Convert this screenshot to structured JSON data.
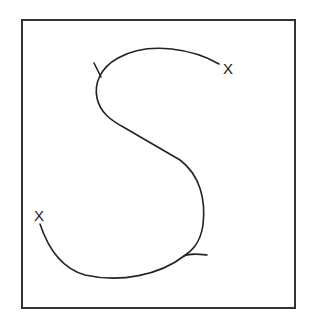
{
  "diagram": {
    "type": "curve-sketch",
    "line_color": "#333333",
    "markers": [
      {
        "label": "X",
        "position": "top-right end of curve"
      },
      {
        "label": "X",
        "position": "bottom-left end of curve"
      }
    ],
    "ticks": [
      {
        "position": "upper-left bend"
      },
      {
        "position": "lower-right bend"
      }
    ]
  }
}
